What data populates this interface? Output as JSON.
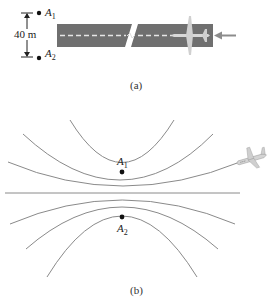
{
  "figure": {
    "part_a": {
      "caption": "(a)",
      "distance_label": "40 m",
      "points": [
        {
          "name": "A",
          "sub": "1"
        },
        {
          "name": "A",
          "sub": "2"
        }
      ],
      "runway_color": "#6f6f6f",
      "centerline_color": "#e6e6e6",
      "arrow_color": "#8c8c8c"
    },
    "part_b": {
      "caption": "(b)",
      "points": [
        {
          "name": "A",
          "sub": "1"
        },
        {
          "name": "A",
          "sub": "2"
        }
      ],
      "curve_color": "#8a8a8a",
      "curve_count": 7
    }
  }
}
